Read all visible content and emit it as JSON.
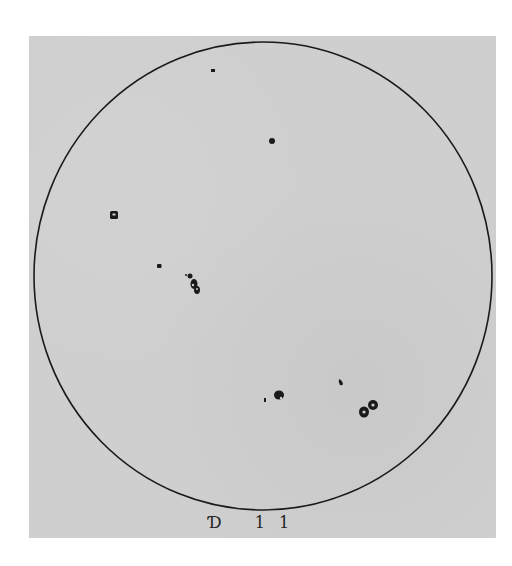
{
  "drawing": {
    "paper_color": "#cfcfcf",
    "ink_color": "#1a1a1a",
    "disk": {
      "cx": 263,
      "cy": 276,
      "rx": 229,
      "ry": 234
    },
    "caption": "Ɗ 11",
    "sunspots": [
      {
        "name": "spot-top-small",
        "x": 213,
        "y": 71,
        "r": 2
      },
      {
        "name": "spot-upper-center",
        "x": 272,
        "y": 141,
        "r": 3
      },
      {
        "name": "spot-left-square",
        "x": 114,
        "y": 215,
        "r": 4
      },
      {
        "name": "spot-left-small",
        "x": 159,
        "y": 266,
        "r": 2.5
      },
      {
        "name": "spot-group-center-left",
        "x": 195,
        "y": 284,
        "r": 5
      },
      {
        "name": "spot-lower-center",
        "x": 279,
        "y": 396,
        "r": 5
      },
      {
        "name": "spot-lower-center-follower",
        "x": 265,
        "y": 400,
        "r": 1.5
      },
      {
        "name": "spot-lower-right-small",
        "x": 341,
        "y": 383,
        "r": 2.5
      },
      {
        "name": "spot-lower-right-pair",
        "x": 368,
        "y": 410,
        "r": 6
      }
    ]
  }
}
